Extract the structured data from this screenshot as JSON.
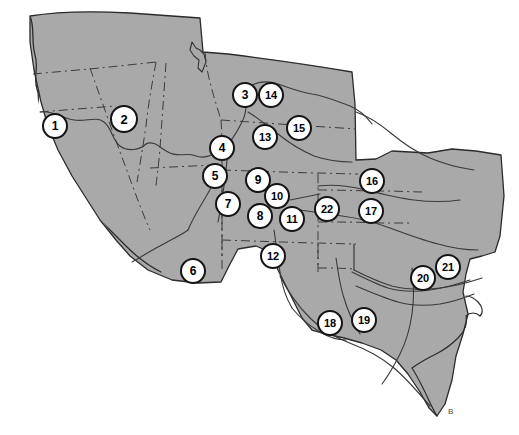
{
  "figure": {
    "type": "reference-map",
    "width": 519,
    "height": 435,
    "background_color": "#ffffff",
    "land_fill_color": "#a9a9a9",
    "land_outline_color": "#2b2b2b",
    "state_border_color": "#3c3c3c",
    "river_color": "#3a3a3a",
    "marker_fill_color": "#ffffff",
    "marker_border_color": "#141414",
    "marker_text_color": "#000000"
  },
  "markers": [
    {
      "id": 1,
      "label": "1",
      "x": 55,
      "y": 126,
      "r": 13
    },
    {
      "id": 2,
      "label": "2",
      "x": 124,
      "y": 119,
      "r": 14
    },
    {
      "id": 3,
      "label": "3",
      "x": 245,
      "y": 95,
      "r": 13
    },
    {
      "id": 4,
      "label": "4",
      "x": 222,
      "y": 148,
      "r": 13
    },
    {
      "id": 5,
      "label": "5",
      "x": 215,
      "y": 176,
      "r": 13
    },
    {
      "id": 6,
      "label": "6",
      "x": 193,
      "y": 271,
      "r": 13
    },
    {
      "id": 7,
      "label": "7",
      "x": 228,
      "y": 204,
      "r": 13
    },
    {
      "id": 8,
      "label": "8",
      "x": 260,
      "y": 216,
      "r": 13
    },
    {
      "id": 9,
      "label": "9",
      "x": 258,
      "y": 180,
      "r": 13
    },
    {
      "id": 10,
      "label": "10",
      "x": 277,
      "y": 196,
      "r": 13
    },
    {
      "id": 11,
      "label": "11",
      "x": 292,
      "y": 219,
      "r": 13
    },
    {
      "id": 12,
      "label": "12",
      "x": 273,
      "y": 256,
      "r": 13
    },
    {
      "id": 13,
      "label": "13",
      "x": 265,
      "y": 137,
      "r": 13
    },
    {
      "id": 14,
      "label": "14",
      "x": 271,
      "y": 95,
      "r": 13
    },
    {
      "id": 15,
      "label": "15",
      "x": 299,
      "y": 128,
      "r": 13
    },
    {
      "id": 16,
      "label": "16",
      "x": 372,
      "y": 181,
      "r": 13
    },
    {
      "id": 17,
      "label": "17",
      "x": 371,
      "y": 211,
      "r": 13
    },
    {
      "id": 18,
      "label": "18",
      "x": 330,
      "y": 323,
      "r": 13
    },
    {
      "id": 19,
      "label": "19",
      "x": 364,
      "y": 320,
      "r": 13
    },
    {
      "id": 20,
      "label": "20",
      "x": 423,
      "y": 278,
      "r": 13
    },
    {
      "id": 21,
      "label": "21",
      "x": 448,
      "y": 267,
      "r": 13
    },
    {
      "id": 22,
      "label": "22",
      "x": 327,
      "y": 209,
      "r": 13
    }
  ],
  "annotations": {
    "corner_mark": "B"
  }
}
